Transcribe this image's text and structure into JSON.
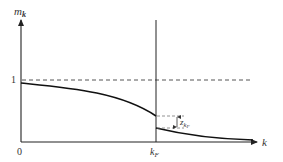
{
  "diagram": {
    "type": "momentum-distribution",
    "y_axis_label": "m",
    "y_axis_subscript": "k",
    "x_axis_label": "k",
    "origin_label": "0",
    "y_tick_label": "1",
    "fermi_label": "k",
    "fermi_subscript": "F",
    "jump_label": "z",
    "jump_subscript": "k",
    "jump_subsubscript": "F",
    "colors": {
      "line": "#222222",
      "dashed": "#555555",
      "text": "#333333"
    }
  }
}
